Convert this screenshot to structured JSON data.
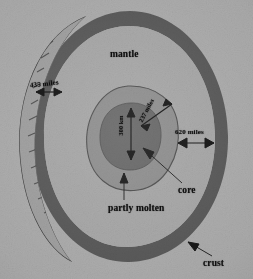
{
  "figure": {
    "kind": "cross-section-diagram",
    "background_color": "#a9a9a9",
    "ink_color": "#101010"
  },
  "layers": {
    "crust": {
      "label": "crust",
      "color": "#5b5b5b"
    },
    "mantle": {
      "label": "mantle",
      "color": "#a2a2a2"
    },
    "partly_molten": {
      "label": "partly molten",
      "color": "#8a8a8a"
    },
    "core": {
      "label": "core",
      "color": "#626262"
    }
  },
  "measurements": [
    {
      "name": "crust-thickness",
      "value": "435 miles",
      "arrow": "double"
    },
    {
      "name": "mantle-thickness",
      "value": "620 miles",
      "arrow": "double"
    },
    {
      "name": "molten-shell-thickness",
      "value": "237 miles",
      "arrow": "double"
    },
    {
      "name": "core-radius",
      "value": "300 km",
      "arrow": "double"
    }
  ],
  "callouts": [
    {
      "name": "core-callout",
      "label": "core"
    },
    {
      "name": "partly-molten-callout",
      "label": "partly molten"
    },
    {
      "name": "crust-callout",
      "label": "crust"
    },
    {
      "name": "mantle-callout",
      "label": "mantle"
    }
  ]
}
